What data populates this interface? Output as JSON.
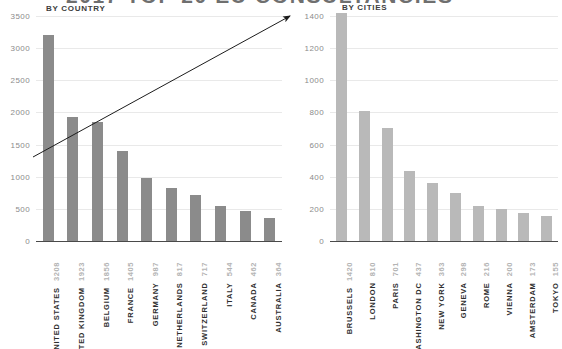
{
  "header": {
    "title": "2017 TOP 20 EU CONSULTANCIES",
    "title_truncated": true
  },
  "panels": {
    "country": {
      "subtitle": "BY COUNTRY"
    },
    "cities": {
      "subtitle": "BY CITIES"
    }
  },
  "annotation": {
    "arrow": "upward-trend-arrow"
  },
  "colors": {
    "bar_country": "#8b8b8b",
    "bar_cities": "#b9b9b9",
    "grid": "#e9e9e9",
    "axis": "#4a4a4a",
    "tick_text": "#8b8b8b",
    "value_text": "#b4b4b4",
    "category_text": "#2e2e2e"
  },
  "chart_data": [
    {
      "type": "bar",
      "title": "BY COUNTRY",
      "xlabel": "",
      "ylabel": "",
      "ylim": [
        0,
        3500
      ],
      "yticks": [
        0,
        500,
        1000,
        1500,
        2000,
        2500,
        3000,
        3500
      ],
      "grid": true,
      "legend": "none",
      "categories": [
        "UNITED STATES",
        "UNITED KINGDOM",
        "BELGIUM",
        "FRANCE",
        "GERMANY",
        "NETHERLANDS",
        "SWITZERLAND",
        "ITALY",
        "CANADA",
        "AUSTRALIA"
      ],
      "values": [
        3208,
        1923,
        1856,
        1405,
        987,
        817,
        717,
        544,
        462,
        364
      ]
    },
    {
      "type": "bar",
      "title": "BY CITIES",
      "xlabel": "",
      "ylabel": "",
      "ylim": [
        0,
        1400
      ],
      "yticks": [
        0,
        200,
        400,
        600,
        800,
        1000,
        1200,
        1400
      ],
      "grid": true,
      "legend": "none",
      "categories": [
        "BRUSSELS",
        "LONDON",
        "PARIS",
        "WASHINGTON DC",
        "NEW YORK",
        "GENEVA",
        "ROME",
        "VIENNA",
        "AMSTERDAM",
        "TOKYO"
      ],
      "values": [
        1420,
        810,
        701,
        437,
        363,
        298,
        216,
        200,
        173,
        155
      ]
    }
  ]
}
